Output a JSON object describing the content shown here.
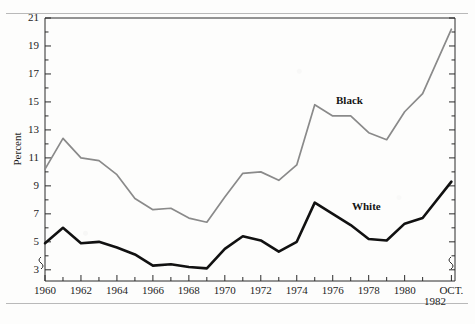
{
  "chart_data": {
    "type": "line",
    "title": "",
    "subtitle": "",
    "xlabel": "",
    "ylabel": "Percent",
    "grid": false,
    "legend_position": "inline-annotation",
    "axis_break": true,
    "xlim": [
      1960,
      1982.8
    ],
    "ylim": [
      2.2,
      21
    ],
    "ytick_labels": [
      "3",
      "5",
      "7",
      "9",
      "11",
      "13",
      "15",
      "17",
      "19",
      "21"
    ],
    "ytick_values": [
      3,
      5,
      7,
      9,
      11,
      13,
      15,
      17,
      19,
      21
    ],
    "yminor_values": [
      4,
      6,
      8,
      10,
      12,
      14,
      16,
      18,
      20
    ],
    "xtick_labels": [
      "1960",
      "1962",
      "1964",
      "1966",
      "1968",
      "1970",
      "1972",
      "1974",
      "1976",
      "1978",
      "1980",
      "OCT."
    ],
    "xtick_values": [
      1960,
      1962,
      1964,
      1966,
      1968,
      1970,
      1972,
      1974,
      1976,
      1978,
      1980,
      1982.6
    ],
    "xtick_second_line": "1982",
    "xminor_values": [
      1961,
      1963,
      1965,
      1967,
      1969,
      1971,
      1973,
      1975,
      1977,
      1979,
      1981
    ],
    "x": [
      1960,
      1961,
      1962,
      1963,
      1964,
      1965,
      1966,
      1967,
      1968,
      1969,
      1970,
      1971,
      1972,
      1973,
      1974,
      1975,
      1976,
      1977,
      1978,
      1979,
      1980,
      1981,
      1982.6
    ],
    "series": [
      {
        "name": "Black",
        "color": "#8a8a8a",
        "width": 1.7,
        "label_x": 1976.0,
        "label_y": 15.4,
        "values": [
          10.2,
          12.4,
          11.0,
          10.8,
          9.8,
          8.1,
          7.3,
          7.4,
          6.7,
          6.4,
          8.2,
          9.9,
          10.0,
          9.4,
          10.5,
          14.8,
          14.0,
          14.0,
          12.8,
          12.3,
          14.3,
          15.6,
          20.2
        ]
      },
      {
        "name": "White",
        "color": "#111111",
        "width": 2.6,
        "label_x": 1976.6,
        "label_y": 7.4,
        "values": [
          4.9,
          6.0,
          4.9,
          5.0,
          4.6,
          4.1,
          3.3,
          3.4,
          3.2,
          3.1,
          4.5,
          5.4,
          5.1,
          4.3,
          5.0,
          7.8,
          7.0,
          6.2,
          5.2,
          5.1,
          6.3,
          6.7,
          9.3
        ]
      }
    ]
  }
}
